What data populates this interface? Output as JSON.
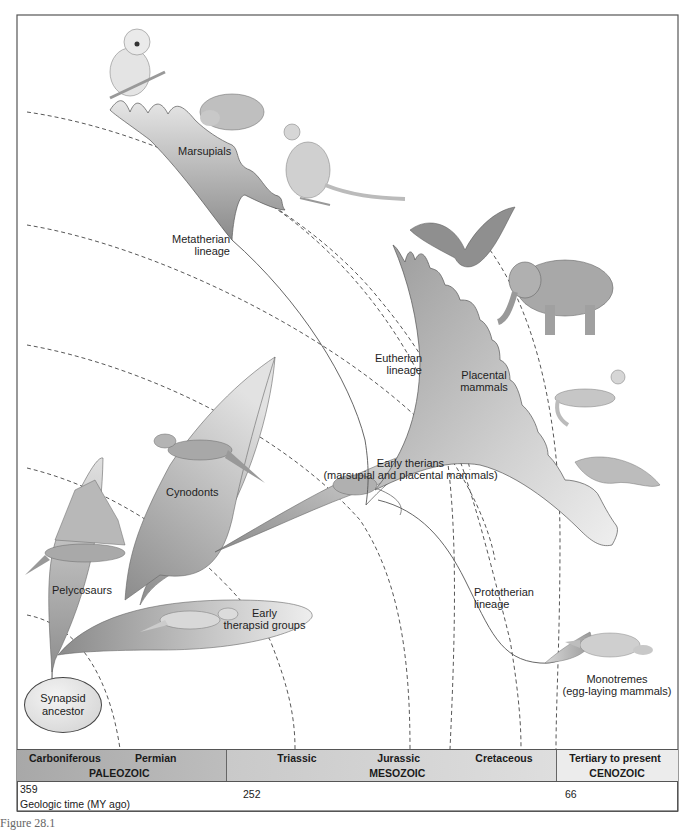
{
  "figure": {
    "type": "phylogenetic-diagram",
    "caption_fragment": "Figure 28.1"
  },
  "clades": {
    "synapsid_ancestor": [
      "Synapsid",
      "ancestor"
    ],
    "pelycosaurs": "Pelycosaurs",
    "early_therapsids": [
      "Early",
      "therapsid groups"
    ],
    "cynodonts": "Cynodonts",
    "early_therians": [
      "Early therians",
      "(marsupial and placental mammals)"
    ],
    "marsupials": "Marsupials",
    "placental_mammals": [
      "Placental",
      "mammals"
    ],
    "monotremes": [
      "Monotremes",
      "(egg-laying mammals)"
    ]
  },
  "lineages": {
    "metatherian": [
      "Metatherian",
      "lineage"
    ],
    "eutherian": [
      "Eutherian",
      "lineage"
    ],
    "prototherian": [
      "Prototherian",
      "lineage"
    ]
  },
  "animals": {
    "marsupials": [
      "koala",
      "wombat",
      "kangaroo"
    ],
    "placentals": [
      "bat",
      "elephant",
      "ferret",
      "manatee"
    ],
    "monotremes": [
      "platypus"
    ],
    "early_therians": [
      "shrew-like mammal"
    ],
    "cynodonts": [
      "cynodont"
    ],
    "pelycosaurs": [
      "dimetrodon"
    ],
    "early_therapsids": [
      "therapsid"
    ]
  },
  "timeline": {
    "periods": {
      "carboniferous": "Carboniferous",
      "permian": "Permian",
      "triassic": "Triassic",
      "jurassic": "Jurassic",
      "cretaceous": "Cretaceous",
      "tertiary": "Tertiary to present"
    },
    "eras": {
      "paleozoic": "PALEOZOIC",
      "mesozoic": "MESOZOIC",
      "cenozoic": "CENOZOIC"
    },
    "ticks": {
      "t359": "359",
      "t252": "252",
      "t66": "66"
    },
    "axis_label": "Geologic time (MY ago)"
  },
  "colors": {
    "frame": "#555555",
    "clade_fill_dark": "#8f8f8f",
    "clade_fill_light": "#e8e8e8",
    "dashed_arc": "#444444",
    "paleozoic_bg": "#b0b0b0",
    "mesozoic_bg": "#d4d4d4",
    "cenozoic_bg": "#ececec"
  }
}
